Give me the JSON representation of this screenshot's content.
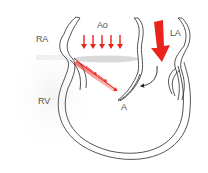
{
  "diagram": {
    "type": "cardiac-cross-section",
    "labels": {
      "ra": "RA",
      "rv": "RV",
      "ao": "Ao",
      "la": "LA",
      "a": "A"
    },
    "colors": {
      "flow_arrow": "#e8241c",
      "outline": "#2a2a2a",
      "shadow": "#c8c8c8",
      "background": "#ffffff",
      "label_text": "#555555"
    },
    "arrows": {
      "aortic_inflow_count": 5,
      "large_mitral_arrow": true,
      "regurgitant_jet": true,
      "curved_black_arrow": true
    }
  }
}
